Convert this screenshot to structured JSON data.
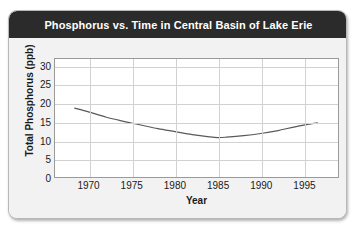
{
  "chart_data": {
    "type": "line",
    "title": "Phosphorus vs. Time in Central Basin of Lake Erie",
    "xlabel": "Year",
    "ylabel": "Total Phosphorus (ppb)",
    "xlim": [
      1966,
      1999
    ],
    "ylim": [
      0,
      32
    ],
    "grid": true,
    "legend": false,
    "line_color": "#595959",
    "xticks": [
      1970,
      1975,
      1980,
      1985,
      1990,
      1995
    ],
    "xtick_labels": [
      "1970",
      "1975",
      "1980",
      "1985",
      "1990",
      "1995"
    ],
    "yticks": [
      0,
      5,
      10,
      15,
      20,
      25,
      30
    ],
    "ytick_labels": [
      "0",
      "5",
      "10",
      "15",
      "20",
      "25",
      "30"
    ],
    "series": [
      {
        "name": "Total Phosphorus",
        "x": [
          1968.3,
          1970,
          1972,
          1974,
          1976,
          1978,
          1980,
          1982,
          1984,
          1985,
          1986,
          1988,
          1990,
          1992,
          1994,
          1996.6
        ],
        "values": [
          18.7,
          17.6,
          16.2,
          15.1,
          14.1,
          13.1,
          12.3,
          11.5,
          10.9,
          10.7,
          10.8,
          11.2,
          11.8,
          12.6,
          13.6,
          14.7
        ]
      }
    ]
  }
}
